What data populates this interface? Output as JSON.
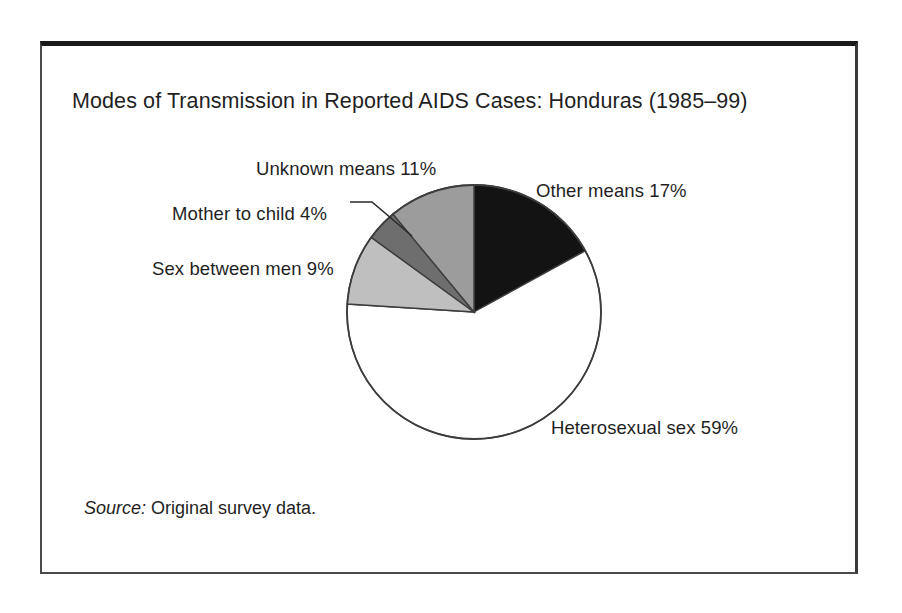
{
  "figure": {
    "title": "Modes of Transmission in Reported AIDS Cases: Honduras (1985–99)",
    "source_label": "Source:",
    "source_text": " Original survey data."
  },
  "chart_data": {
    "type": "pie",
    "title": "Modes of Transmission in Reported AIDS Cases: Honduras (1985–99)",
    "xlabel": "",
    "ylabel": "",
    "units": "percent",
    "total": 100,
    "start_angle_deg": 0,
    "direction": "clockwise",
    "legend": "none (direct labels)",
    "grid": false,
    "categories": [
      "Other means",
      "Heterosexual sex",
      "Sex between men",
      "Mother to child",
      "Unknown means"
    ],
    "values": [
      17,
      59,
      9,
      4,
      11
    ],
    "labels": [
      "Other means 17%",
      "Heterosexual sex 59%",
      "Sex between men 9%",
      "Mother to child 4%",
      "Unknown means 11%"
    ],
    "colors": [
      "#131313",
      "#ffffff",
      "#bfbfbf",
      "#6e6e6e",
      "#9c9c9c"
    ],
    "slices": [
      {
        "name": "Other means",
        "value": 17,
        "label": "Other means 17%",
        "color": "#131313",
        "start_deg": 0,
        "end_deg": 61.2
      },
      {
        "name": "Heterosexual sex",
        "value": 59,
        "label": "Heterosexual sex 59%",
        "color": "#ffffff",
        "start_deg": 61.2,
        "end_deg": 273.6
      },
      {
        "name": "Sex between men",
        "value": 9,
        "label": "Sex between men 9%",
        "color": "#bfbfbf",
        "start_deg": 273.6,
        "end_deg": 306.0
      },
      {
        "name": "Mother to child",
        "value": 4,
        "label": "Mother to child 4%",
        "color": "#6e6e6e",
        "start_deg": 306.0,
        "end_deg": 320.4
      },
      {
        "name": "Unknown means",
        "value": 11,
        "label": "Unknown means 11%",
        "color": "#9c9c9c",
        "start_deg": 320.4,
        "end_deg": 360.0
      }
    ],
    "source": "Original survey data."
  }
}
